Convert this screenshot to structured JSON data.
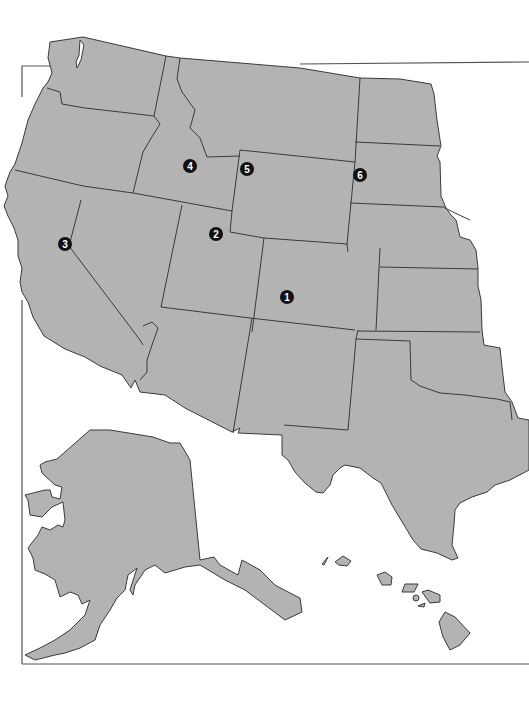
{
  "map": {
    "title": "",
    "region": "Western United States",
    "fill_color": "#b3b3b3",
    "border_color": "#3a3a3a",
    "background_color": "#ffffff",
    "markers": [
      {
        "label": "1",
        "x": 287,
        "y": 297
      },
      {
        "label": "2",
        "x": 216,
        "y": 234
      },
      {
        "label": "3",
        "x": 65,
        "y": 244
      },
      {
        "label": "4",
        "x": 190,
        "y": 166
      },
      {
        "label": "5",
        "x": 247,
        "y": 169
      },
      {
        "label": "6",
        "x": 360,
        "y": 175
      }
    ],
    "insets": [
      "Alaska",
      "Hawaii"
    ]
  }
}
